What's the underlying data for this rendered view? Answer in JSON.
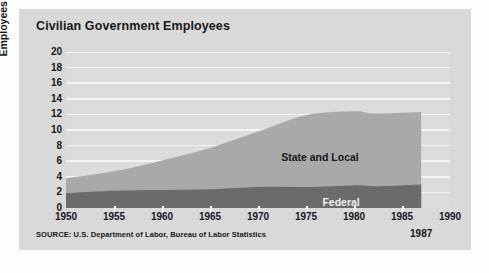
{
  "title": "Civilian Government Employees",
  "source": "SOURCE: U.S. Department of Labor, Bureau of Labor Statistics",
  "end_year_note": "1987",
  "colors": {
    "panel": "#d9d9d9",
    "plot": "#dcdcdc",
    "gridline": "#f4f4f4",
    "federal": "#6b6b6b",
    "state_and_local": "#a9a9a9",
    "text": "#18181a",
    "federal_label_text": "#f2f2f2"
  },
  "chart_data": {
    "type": "area",
    "stacked": true,
    "title": "Civilian Government Employees",
    "xlabel": "",
    "ylabel": "Employees (millions)",
    "xlim": [
      1950,
      1990
    ],
    "ylim": [
      0,
      20
    ],
    "xticks": [
      1950,
      1955,
      1960,
      1965,
      1970,
      1975,
      1980,
      1985,
      1990
    ],
    "yticks": [
      0,
      2,
      4,
      6,
      8,
      10,
      12,
      14,
      16,
      18,
      20
    ],
    "grid": true,
    "legend": "inline-labels",
    "data_end_year": 1987,
    "annotations": [
      {
        "text": "State and Local",
        "x": 1977,
        "y": 6.6
      },
      {
        "text": "Federal",
        "x": 1979,
        "y": 0.75
      },
      {
        "text": "1987",
        "x": 1987,
        "y": -3.2
      }
    ],
    "x": [
      1950,
      1955,
      1960,
      1965,
      1970,
      1975,
      1980,
      1982,
      1985,
      1987
    ],
    "series": [
      {
        "name": "Federal",
        "values": [
          1.9,
          2.2,
          2.3,
          2.4,
          2.7,
          2.7,
          2.9,
          2.8,
          2.9,
          3.0
        ]
      },
      {
        "name": "State and Local",
        "values": [
          3.8,
          4.7,
          6.1,
          7.7,
          9.8,
          11.9,
          12.4,
          12.1,
          12.2,
          12.3
        ]
      }
    ],
    "series_note": "State and Local values are cumulative tops of the stack; Federal is the lower band"
  },
  "axis": {
    "y_title": "Employees (millions)",
    "y_labels": [
      "20",
      "18",
      "16",
      "14",
      "12",
      "10",
      "8",
      "6",
      "4",
      "2",
      "0"
    ],
    "x_labels": [
      "1950",
      "1955",
      "1960",
      "1965",
      "1970",
      "1975",
      "1980",
      "1985",
      "1990"
    ]
  },
  "labels": {
    "state_and_local": "State and Local",
    "federal": "Federal"
  }
}
